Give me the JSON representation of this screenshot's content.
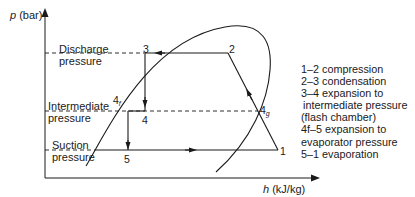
{
  "axes": {
    "y_label_var": "p",
    "y_label_unit": " (bar)",
    "x_label_var": "h",
    "x_label_unit": " (kJ/kg)"
  },
  "pressure_levels": {
    "discharge": [
      "Discharge",
      "pressure"
    ],
    "intermediate": [
      "Intermediate",
      "pressure"
    ],
    "suction": [
      "Suction",
      "pressure"
    ]
  },
  "points": {
    "p1": "1",
    "p2": "2",
    "p3": "3",
    "p4": "4",
    "p4f_main": "4",
    "p4f_sub": "f",
    "p4g_main": "4",
    "p4g_sub": "g",
    "p5": "5"
  },
  "legend": [
    "1–2 compression",
    "2–3 condensation",
    "3–4 expansion to",
    "intermediate pressure",
    "(flash chamber)",
    "4f–5 expansion to",
    "evaporator pressure",
    "5–1 evaporation"
  ],
  "colors": {
    "line": "#1a1a1a",
    "background": "#ffffff"
  }
}
